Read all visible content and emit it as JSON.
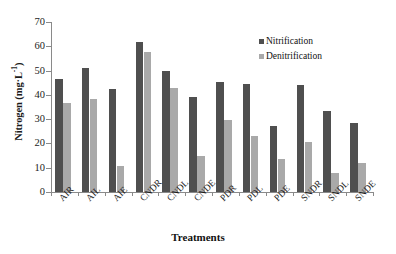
{
  "chart_data": {
    "type": "bar",
    "title": "",
    "xlabel": "Treatments",
    "ylabel": "Nitrogen (mg·L⁻¹)",
    "ylabel_main": "Nitrogen (mg·L",
    "ylabel_sup": "-1",
    "ylabel_tail": ")",
    "ylim": [
      0,
      70
    ],
    "yticks": [
      0,
      10,
      20,
      30,
      40,
      50,
      60,
      70
    ],
    "ytick_labels": [
      "0",
      "10",
      "20",
      "30",
      "40",
      "50",
      "60",
      "70"
    ],
    "grid": false,
    "legend_position": "top-right",
    "categories": [
      "AIR",
      "AIL",
      "AIE",
      "CNDR",
      "CNDL",
      "CNDE",
      "PDR",
      "PDL",
      "PDE",
      "SNDR",
      "SNDL",
      "SNDE"
    ],
    "series": [
      {
        "name": "Nitrification",
        "color": "#4f4f4f",
        "values": [
          46.5,
          51.0,
          42.5,
          61.8,
          50.0,
          39.0,
          45.5,
          44.5,
          27.0,
          44.0,
          33.5,
          28.5
        ]
      },
      {
        "name": "Denitrification",
        "color": "#a9a9a9",
        "values": [
          36.5,
          38.5,
          10.8,
          57.8,
          43.0,
          14.8,
          29.8,
          23.0,
          13.8,
          20.5,
          7.8,
          11.8
        ]
      }
    ]
  }
}
